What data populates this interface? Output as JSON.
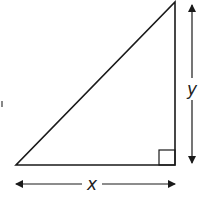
{
  "diagram": {
    "type": "right-triangle",
    "labels": {
      "horizontal_leg": "x",
      "vertical_leg": "y"
    },
    "right_angle_marker": true,
    "colors": {
      "stroke": "#1a1a1a",
      "label": "#222222",
      "background": "#ffffff"
    }
  }
}
